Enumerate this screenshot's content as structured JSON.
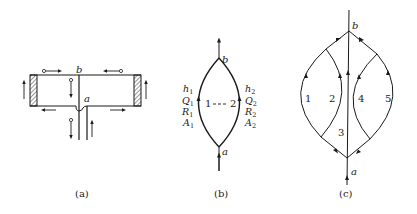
{
  "figure": {
    "panels": [
      {
        "id": "a",
        "caption": "(a)",
        "node_labels": {
          "top": "b",
          "bottom": "a"
        }
      },
      {
        "id": "b",
        "caption": "(b)",
        "node_labels": {
          "top": "b",
          "bottom": "a"
        },
        "branch_1": {
          "h": "h",
          "h_sub": "1",
          "Q": "Q",
          "Q_sub": "1",
          "R": "R",
          "R_sub": "1",
          "A": "A",
          "A_sub": "1"
        },
        "branch_2": {
          "h": "h",
          "h_sub": "2",
          "Q": "Q",
          "Q_sub": "2",
          "R": "R",
          "R_sub": "2",
          "A": "A",
          "A_sub": "2"
        },
        "connector_label": "1 - - - 2",
        "left_num": "1",
        "right_num": "2"
      },
      {
        "id": "c",
        "caption": "(c)",
        "node_labels": {
          "top": "b",
          "bottom": "a"
        },
        "branch_labels": [
          "1",
          "2",
          "3",
          "4",
          "5"
        ]
      }
    ],
    "colors": {
      "ink": "#1a1a1a",
      "background": "#ffffff"
    }
  }
}
